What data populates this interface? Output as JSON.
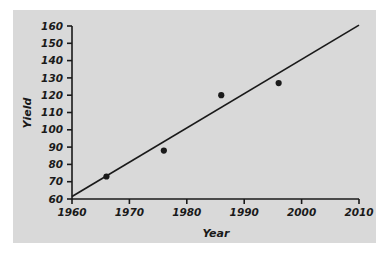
{
  "figure": {
    "background_color": "#ffffff",
    "panel_color": "#d9d9d9",
    "ink_color": "#1a1a1a"
  },
  "chart_data": {
    "type": "scatter",
    "title": "",
    "subtitle": "",
    "xlabel": "Year",
    "ylabel": "Yield",
    "xlim": [
      1960,
      2010
    ],
    "ylim": [
      60,
      160
    ],
    "xticks": [
      1960,
      1970,
      1980,
      1990,
      2000,
      2010
    ],
    "yticks": [
      60,
      70,
      80,
      90,
      100,
      110,
      120,
      130,
      140,
      150,
      160
    ],
    "xtick_labels": [
      "1960",
      "1970",
      "1980",
      "1990",
      "2000",
      "2010"
    ],
    "ytick_labels": [
      "60",
      "70",
      "80",
      "90",
      "100",
      "110",
      "120",
      "130",
      "140",
      "150",
      "160"
    ],
    "grid": false,
    "legend": false,
    "legend_position": "none",
    "series": [
      {
        "name": "Observations",
        "type": "scatter",
        "marker": "filled-circle",
        "color": "#1a1a1a",
        "x": [
          1966,
          1976,
          1986,
          1996
        ],
        "y": [
          73,
          88,
          120,
          127
        ],
        "points": [
          {
            "x": 1966,
            "y": 73
          },
          {
            "x": 1976,
            "y": 88
          },
          {
            "x": 1986,
            "y": 120
          },
          {
            "x": 1996,
            "y": 127
          }
        ]
      },
      {
        "name": "Fitted line",
        "type": "line",
        "color": "#1a1a1a",
        "x": [
          1960,
          2010
        ],
        "y": [
          61.5,
          160.5
        ],
        "points": [
          {
            "x": 1960,
            "y": 61.5
          },
          {
            "x": 2010,
            "y": 160.5
          }
        ]
      }
    ]
  }
}
